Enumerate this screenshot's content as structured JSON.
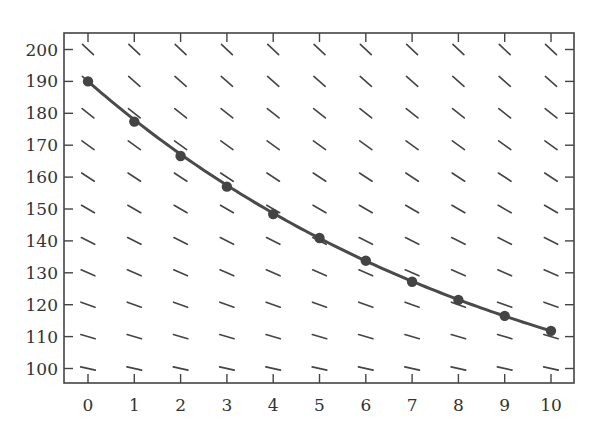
{
  "chart_data": {
    "type": "line",
    "title": "",
    "xlabel": "",
    "ylabel": "",
    "xlim": [
      0,
      10
    ],
    "ylim": [
      95,
      205
    ],
    "x_ticks": [
      0,
      1,
      2,
      3,
      4,
      5,
      6,
      7,
      8,
      9,
      10
    ],
    "y_ticks": [
      100,
      110,
      120,
      130,
      140,
      150,
      160,
      170,
      180,
      190,
      200
    ],
    "grid": false,
    "legend": null,
    "series": [
      {
        "name": "solution",
        "markers": true,
        "x": [
          0,
          1,
          2,
          3,
          4,
          5,
          6,
          7,
          8,
          9,
          10
        ],
        "values": [
          190,
          177.4,
          166.6,
          157,
          148.4,
          140.9,
          133.8,
          127.2,
          121.5,
          116.5,
          111.8
        ]
      }
    ],
    "slope_field": {
      "model": "dT/dt = -k (T - Ta)",
      "k": 0.1055,
      "Ta": 70,
      "x_positions": [
        0,
        1,
        2,
        3,
        4,
        5,
        6,
        7,
        8,
        9,
        10
      ],
      "y_positions": [
        100,
        110,
        120,
        130,
        140,
        150,
        160,
        170,
        180,
        190,
        200
      ]
    },
    "colors": {
      "line": "#4a4a4a",
      "marker": "#444444",
      "frame": "#444444",
      "text": "#333333"
    }
  }
}
